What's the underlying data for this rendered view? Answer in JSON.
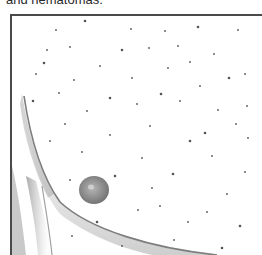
{
  "caption": {
    "text": "and hematomas."
  },
  "figure": {
    "colors": {
      "border": "#4a4a4a",
      "contour": "#8a8a8a",
      "shading": "#b8b8b8",
      "areola": "#8c8c8c",
      "dot": "#555555"
    },
    "areola": {
      "cx": 82,
      "cy": 174,
      "rx": 15,
      "ry": 14
    },
    "dots": [
      [
        73,
        5
      ],
      [
        44,
        14
      ],
      [
        119,
        13
      ],
      [
        153,
        15
      ],
      [
        186,
        11
      ],
      [
        226,
        14
      ],
      [
        35,
        34
      ],
      [
        58,
        31
      ],
      [
        110,
        34
      ],
      [
        137,
        32
      ],
      [
        166,
        30
      ],
      [
        88,
        50
      ],
      [
        32,
        47
      ],
      [
        156,
        52
      ],
      [
        178,
        46
      ],
      [
        202,
        38
      ],
      [
        217,
        62
      ],
      [
        24,
        58
      ],
      [
        62,
        64
      ],
      [
        120,
        62
      ],
      [
        149,
        78
      ],
      [
        188,
        70
      ],
      [
        233,
        58
      ],
      [
        47,
        77
      ],
      [
        98,
        82
      ],
      [
        168,
        85
      ],
      [
        206,
        94
      ],
      [
        235,
        90
      ],
      [
        21,
        85
      ],
      [
        75,
        95
      ],
      [
        125,
        88
      ],
      [
        138,
        110
      ],
      [
        178,
        125
      ],
      [
        53,
        108
      ],
      [
        98,
        119
      ],
      [
        130,
        142
      ],
      [
        193,
        117
      ],
      [
        224,
        108
      ],
      [
        38,
        125
      ],
      [
        70,
        136
      ],
      [
        161,
        158
      ],
      [
        200,
        140
      ],
      [
        236,
        122
      ],
      [
        58,
        164
      ],
      [
        103,
        160
      ],
      [
        140,
        172
      ],
      [
        215,
        178
      ],
      [
        233,
        156
      ],
      [
        85,
        206
      ],
      [
        126,
        194
      ],
      [
        148,
        190
      ],
      [
        176,
        206
      ],
      [
        228,
        210
      ],
      [
        60,
        220
      ],
      [
        162,
        224
      ],
      [
        195,
        196
      ],
      [
        210,
        232
      ],
      [
        110,
        230
      ]
    ]
  }
}
